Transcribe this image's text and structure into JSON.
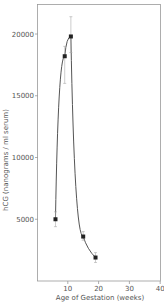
{
  "chart_data": {
    "type": "line",
    "title": "",
    "xlabel": "Age of Gestation (weeks)",
    "ylabel": "hCG (nanograms / ml serum)",
    "xlim": [
      0,
      40
    ],
    "ylim": [
      0,
      23000
    ],
    "x_ticks": [
      10,
      20,
      30,
      40
    ],
    "y_ticks": [
      5000,
      10000,
      15000,
      20000
    ],
    "grid": false,
    "legend": null,
    "series": [
      {
        "name": "hCG",
        "x": [
          6,
          9,
          11,
          15,
          19
        ],
        "values": [
          5000,
          18200,
          19800,
          3600,
          1900
        ],
        "error_upper": [
          5600,
          19000,
          21400,
          4000,
          2300
        ],
        "error_lower": [
          4400,
          16000,
          18500,
          3300,
          1500
        ]
      }
    ]
  },
  "axes": {
    "x_tick_labels": [
      "10",
      "20",
      "30",
      "40"
    ],
    "y_tick_labels": [
      "5000",
      "10000",
      "15000",
      "20000"
    ],
    "x_title": "Age of Gestation (weeks)",
    "y_title": "hCG (nanograms / ml serum)"
  },
  "colors": {
    "line": "#555555",
    "marker": "#222222",
    "axis": "#888888"
  }
}
